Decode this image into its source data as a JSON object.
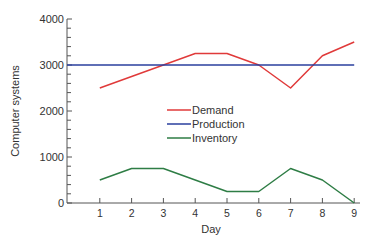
{
  "chart_data": {
    "type": "line",
    "title": "",
    "xlabel": "Day",
    "ylabel": "Computer systems",
    "x": [
      1,
      2,
      3,
      4,
      5,
      6,
      7,
      8,
      9
    ],
    "xlim": [
      0,
      9
    ],
    "ylim": [
      0,
      4000
    ],
    "x_ticks": [
      "1",
      "2",
      "3",
      "4",
      "5",
      "6",
      "7",
      "8",
      "9"
    ],
    "y_ticks": [
      "0",
      "1000",
      "2000",
      "3000",
      "4000"
    ],
    "y_minor_step": 200,
    "grid": false,
    "legend_position": "center",
    "series": [
      {
        "name": "Demand",
        "color": "#e03a3a",
        "values": [
          2500,
          2750,
          3000,
          3250,
          3250,
          3000,
          2500,
          3200,
          3500
        ]
      },
      {
        "name": "Production",
        "color": "#2a3f9e",
        "values": [
          3000,
          3000,
          3000,
          3000,
          3000,
          3000,
          3000,
          3000,
          3000
        ],
        "full_width": true
      },
      {
        "name": "Inventory",
        "color": "#2e7d45",
        "values": [
          500,
          750,
          750,
          500,
          250,
          250,
          750,
          500,
          0
        ]
      }
    ]
  }
}
